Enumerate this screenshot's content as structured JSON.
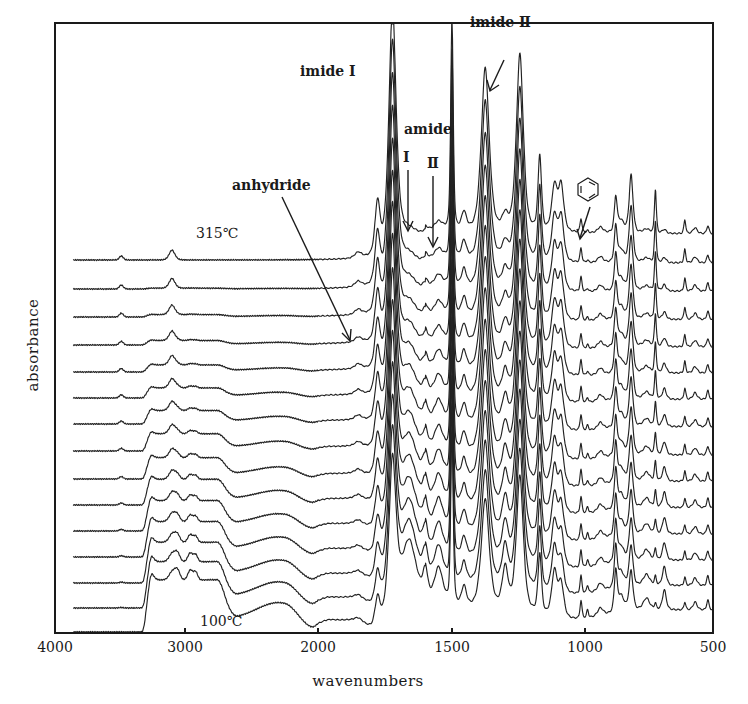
{
  "chart_data": {
    "type": "line",
    "subtype": "stacked FTIR spectra (offset traces)",
    "title": "",
    "xlabel": "wavenumbers",
    "ylabel": "absorbance",
    "x_axis": {
      "direction": "reversed",
      "range": [
        4000,
        500
      ],
      "ticks": [
        4000,
        3000,
        2000,
        1500,
        1000,
        500
      ],
      "tick_labels": [
        "4000",
        "3000",
        "2000",
        "1500",
        "1000",
        "500"
      ],
      "scale_note": "scale expands 2x below 2000 cm-1",
      "tick_pixels": [
        55,
        185,
        318,
        452,
        585,
        713
      ]
    },
    "y_axis": {
      "ticks": [],
      "grid": false
    },
    "grid": false,
    "legend": null,
    "series_count": 15,
    "series": [
      {
        "name": "315°C",
        "order": 0,
        "baseline_px": 260
      },
      {
        "name": "trace 2",
        "order": 1,
        "baseline_px": 289
      },
      {
        "name": "trace 3",
        "order": 2,
        "baseline_px": 317
      },
      {
        "name": "trace 4",
        "order": 3,
        "baseline_px": 345
      },
      {
        "name": "trace 5",
        "order": 4,
        "baseline_px": 372
      },
      {
        "name": "trace 6",
        "order": 5,
        "baseline_px": 398
      },
      {
        "name": "trace 7",
        "order": 6,
        "baseline_px": 424
      },
      {
        "name": "trace 8",
        "order": 7,
        "baseline_px": 451
      },
      {
        "name": "trace 9",
        "order": 8,
        "baseline_px": 479
      },
      {
        "name": "trace 10",
        "order": 9,
        "baseline_px": 505
      },
      {
        "name": "trace 11",
        "order": 10,
        "baseline_px": 531
      },
      {
        "name": "trace 12",
        "order": 11,
        "baseline_px": 557
      },
      {
        "name": "trace 13",
        "order": 12,
        "baseline_px": 583
      },
      {
        "name": "trace 14",
        "order": 13,
        "baseline_px": 608
      },
      {
        "name": "100°C",
        "order": 14,
        "baseline_px": 632
      }
    ],
    "peaks_cm-1": {
      "anhydride": 1850,
      "imide_I_shoulder": 1780,
      "imide_I": 1720,
      "amide_I": 1660,
      "amide_II": 1550,
      "aromatic_ring": 1500,
      "imide_II": 1375,
      "ether": 1245,
      "other": [
        1170,
        1115,
        1090,
        1015,
        880,
        820,
        725,
        610,
        515
      ],
      "broad_NH_OH_band_low_T": [
        3300,
        3050,
        2950,
        2600
      ]
    },
    "annotations": [
      {
        "text": "imide Ⅰ",
        "x_cm": 1720
      },
      {
        "text": "imide Ⅱ",
        "x_cm": 1375
      },
      {
        "text": "amide",
        "x_cm": 1600
      },
      {
        "text": "Ⅰ",
        "x_cm": 1660
      },
      {
        "text": "Ⅱ",
        "x_cm": 1550
      },
      {
        "text": "anhydride",
        "x_cm": 1850
      },
      {
        "text": "benzene-ring",
        "x_cm": 1015
      },
      {
        "text": "315℃",
        "series": "top"
      },
      {
        "text": "100℃",
        "series": "bottom"
      }
    ]
  },
  "labels": {
    "xlabel": "wavenumbers",
    "ylabel": "absorbance",
    "ticks": [
      "4000",
      "3000",
      "2000",
      "1500",
      "1000",
      "500"
    ],
    "imide1": "imide  Ⅰ",
    "imide2": "imide  Ⅱ",
    "amide": "amide",
    "amide1": "Ⅰ",
    "amide2": "Ⅱ",
    "anhydride": "anhydride",
    "temp_top": "315℃",
    "temp_bottom": "100℃"
  },
  "colors": {
    "ink": "#1a1a1a",
    "background": "#ffffff"
  }
}
